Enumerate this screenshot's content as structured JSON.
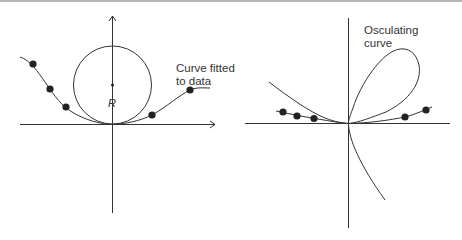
{
  "figure": {
    "left_panel": {
      "label_line1": "Curve fitted",
      "label_line2": "to data",
      "radius_label": "R",
      "elements": [
        "x-axis with arrow",
        "y-axis with arrow",
        "osculating circle",
        "fitted curve",
        "5 data points",
        "circle center point"
      ]
    },
    "right_panel": {
      "label_line1": "Osculating",
      "label_line2": "curve",
      "elements": [
        "x-axis",
        "y-axis",
        "looped osculating curve",
        "fitted curve",
        "5 data points"
      ]
    },
    "colors": {
      "stroke": "#333333",
      "background": "#ffffff",
      "top_border": "#b5b5b5"
    }
  }
}
